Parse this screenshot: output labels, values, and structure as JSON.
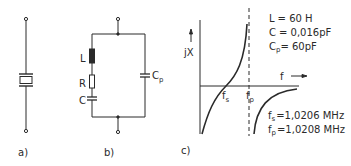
{
  "panels": {
    "a": {
      "label": "a)",
      "component": "quartz-crystal-symbol"
    },
    "b": {
      "label": "b)",
      "components": {
        "L": "L",
        "R": "R",
        "C": "C",
        "Cp": {
          "main": "C",
          "sub": "p"
        }
      }
    },
    "c": {
      "label": "c)",
      "y_axis": {
        "main": "jX"
      },
      "x_axis": {
        "main": "f"
      },
      "markers": {
        "fs": {
          "main": "f",
          "sub": "s"
        },
        "fp": {
          "main": "f",
          "sub": "p"
        }
      },
      "params": [
        {
          "main": "L",
          "sub": "",
          "value": "= 60 H"
        },
        {
          "main": "C",
          "sub": "",
          "value": "= 0,016pF"
        },
        {
          "main": "C",
          "sub": "p",
          "value": "= 60pF"
        }
      ],
      "results": [
        {
          "main": "f",
          "sub": "s",
          "value": "=1,0206 MHz"
        },
        {
          "main": "f",
          "sub": "p",
          "value": "=1,0208 MHz"
        }
      ]
    }
  },
  "colors": {
    "ink": "#2a2a2a",
    "background": "#ffffff"
  }
}
